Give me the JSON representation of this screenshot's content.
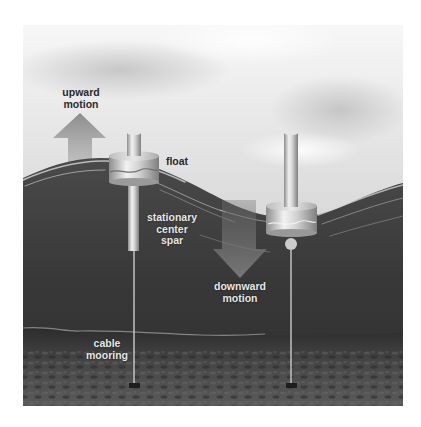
{
  "diagram": {
    "type": "wave-energy-buoy-illustration",
    "labels": {
      "upward_motion": [
        "upward",
        "motion"
      ],
      "float": "float",
      "stationary_center_spar": [
        "stationary",
        "center",
        "spar"
      ],
      "downward_motion": [
        "downward",
        "motion"
      ],
      "cable_mooring": [
        "cable",
        "mooring"
      ]
    },
    "colors": {
      "page_background": "#ffffff",
      "sky_light": "#f2f2f2",
      "sky_mid": "#cfcfcf",
      "water": "#3a3a3a",
      "water_deep": "#2e2e2e",
      "seabed": "#4a4a4a",
      "metal_light": "#e8e8e8",
      "metal_dark": "#8a8a8a",
      "arrow": "#7a7a7a",
      "label_dark": "#2b2b2b",
      "label_light": "#e6e6e6"
    }
  }
}
